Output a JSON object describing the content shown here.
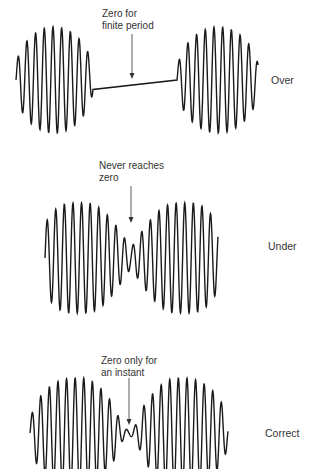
{
  "figure": {
    "panels": [
      {
        "id": "over",
        "label": "Over",
        "annotation_line1": "Zero for",
        "annotation_line2": "finite period",
        "description": "Two separate wave bursts separated by a flat zero-amplitude line"
      },
      {
        "id": "under",
        "label": "Under",
        "annotation_line1": "Never reaches",
        "annotation_line2": "zero",
        "description": "Two wave bursts whose envelope dips but never reaches zero amplitude"
      },
      {
        "id": "correct",
        "label": "Correct",
        "annotation_line1": "Zero only for",
        "annotation_line2": "an instant",
        "description": "Two wave bursts whose envelope touches zero only momentarily"
      }
    ],
    "colors": {
      "stroke": "#1a1a1a",
      "text": "#333333",
      "background": "#ffffff"
    }
  }
}
